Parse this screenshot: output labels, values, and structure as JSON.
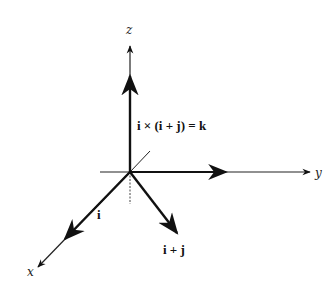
{
  "diagram": {
    "type": "3d-vector-cross-product",
    "axes": {
      "x": {
        "label": "x"
      },
      "y": {
        "label": "y"
      },
      "z": {
        "label": "z"
      }
    },
    "vectors": [
      {
        "name": "i",
        "label": "i"
      },
      {
        "name": "i_plus_j",
        "label": "i + j"
      },
      {
        "name": "cross",
        "label": "i × (i + j) = k"
      }
    ],
    "colors": {
      "ink": "#111111",
      "background": "#ffffff"
    }
  }
}
